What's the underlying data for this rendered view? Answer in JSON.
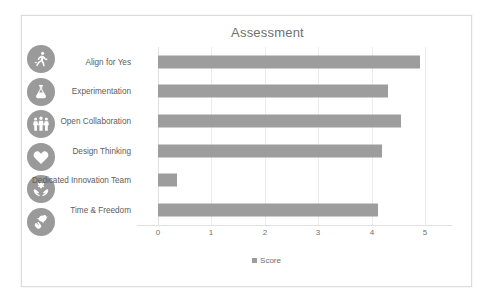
{
  "card": {
    "border_color": "#dcdcdc",
    "background": "#ffffff"
  },
  "chart_data": {
    "type": "bar",
    "orientation": "horizontal",
    "title": "Assessment",
    "xlabel": "",
    "ylabel": "",
    "xlim": [
      0,
      5
    ],
    "xticks": [
      "0",
      "1",
      "2",
      "3",
      "4",
      "5"
    ],
    "grid": true,
    "legend_position": "bottom",
    "series_name": "Score",
    "bar_color": "#9d9d9d",
    "categories": [
      "Align for Yes",
      "Experimentation",
      "Open Collaboration",
      "Design Thinking",
      "Dedicated Innovation Team",
      "Time & Freedom"
    ],
    "values": [
      4.9,
      4.3,
      4.55,
      4.2,
      0.36,
      4.12
    ]
  },
  "legend": {
    "label": "Score",
    "swatch_color": "#9d9d9d"
  },
  "icon_rail": {
    "badge_color": "#9a9a9a",
    "items": [
      {
        "name": "running-person-icon",
        "for_category": "Align for Yes"
      },
      {
        "name": "lab-flask-icon",
        "for_category": "Experimentation"
      },
      {
        "name": "collaborating-people-icon",
        "for_category": "Open Collaboration"
      },
      {
        "name": "heart-brain-icon",
        "for_category": "Design Thinking"
      },
      {
        "name": "hands-holding-gear-icon",
        "for_category": "Dedicated Innovation Team"
      },
      {
        "name": "hand-releasing-bird-icon",
        "for_category": "Time & Freedom"
      }
    ]
  }
}
